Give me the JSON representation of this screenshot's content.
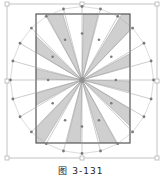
{
  "figure": {
    "caption": "图 3-131",
    "colors": {
      "frame": "#555555",
      "ray_fill": "#cfcfcf",
      "ray_stroke": "#9a9a9a",
      "handle_line": "#9a9a9a",
      "handle_dot": "#7a7a7a",
      "bbox": "#b5b5b5",
      "center": "#888888"
    },
    "bounding_box": {
      "x": 7,
      "y": 4,
      "w": 150,
      "h": 154
    },
    "inner_rect": {
      "x": 36,
      "y": 14,
      "w": 94,
      "h": 129
    },
    "center": {
      "x": 82,
      "y": 80
    },
    "ray_count": 12
  }
}
